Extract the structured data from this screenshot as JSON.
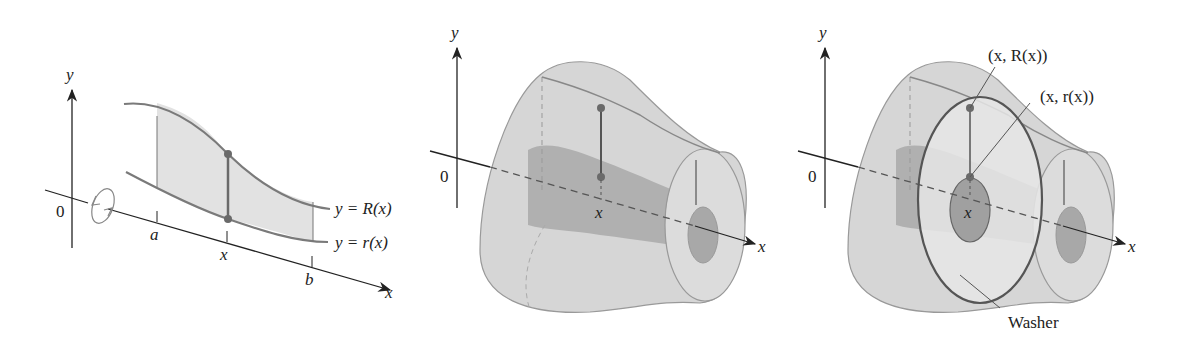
{
  "colors": {
    "curve": "#7a7a7a",
    "region_fill": "#e2e2e2",
    "solid_fill": "#d6d6d6",
    "inner_fill": "#a8a8a8",
    "axis": "#222222",
    "dot": "#6a6a6a"
  },
  "panel1": {
    "y_axis_label": "y",
    "x_axis_label": "x",
    "origin_label": "0",
    "tick_a": "a",
    "tick_x": "x",
    "tick_b": "b",
    "upper_curve_label": "y = R(x)",
    "lower_curve_label": "y = r(x)",
    "rotation_icon": "rotation-arrow-icon"
  },
  "panel2": {
    "y_axis_label": "y",
    "x_axis_label": "x",
    "origin_label": "0",
    "tick_x": "x"
  },
  "panel3": {
    "y_axis_label": "y",
    "x_axis_label": "x",
    "origin_label": "0",
    "tick_x": "x",
    "point_outer_label": "(x, R(x))",
    "point_inner_label": "(x, r(x))",
    "washer_label": "Washer"
  }
}
